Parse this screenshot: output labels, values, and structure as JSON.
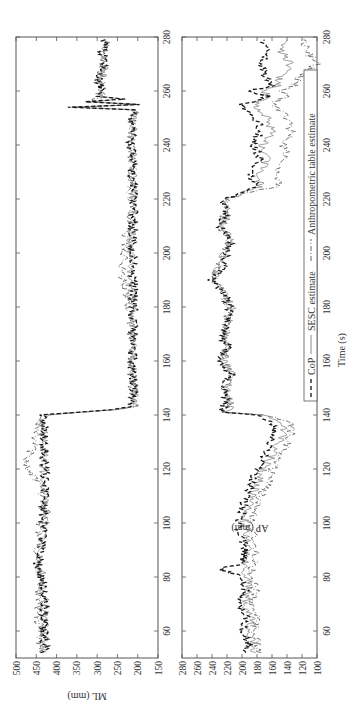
{
  "chart_data": [
    {
      "type": "line",
      "panel": "top",
      "ylabel": "ML (mm)",
      "xlabel": "",
      "xlim": [
        50,
        280
      ],
      "ylim": [
        150,
        500
      ],
      "yticks": [
        500,
        450,
        400,
        350,
        300,
        250,
        200,
        150
      ],
      "xticks": [
        60,
        80,
        100,
        120,
        140,
        160,
        180,
        200,
        220,
        240,
        260,
        280
      ],
      "grid": false,
      "series": [
        {
          "name": "CoP",
          "style": "dashed",
          "x": [
            52,
            60,
            70,
            80,
            85,
            90,
            100,
            110,
            120,
            130,
            136,
            138,
            140,
            141,
            142,
            143,
            145,
            150,
            160,
            170,
            180,
            190,
            200,
            210,
            220,
            230,
            240,
            250,
            253,
            254,
            255,
            256,
            257,
            258,
            260,
            265,
            270,
            275,
            279
          ],
          "y": [
            430,
            432,
            428,
            437,
            448,
            440,
            430,
            430,
            428,
            430,
            432,
            440,
            430,
            350,
            260,
            215,
            208,
            212,
            215,
            212,
            210,
            212,
            215,
            212,
            210,
            212,
            215,
            212,
            205,
            372,
            195,
            330,
            240,
            300,
            290,
            295,
            285,
            285,
            280
          ]
        },
        {
          "name": "SESC estimate",
          "style": "solid",
          "x": [
            52,
            60,
            70,
            80,
            85,
            90,
            100,
            110,
            120,
            130,
            136,
            138,
            140,
            141,
            142,
            143,
            145,
            150,
            160,
            170,
            180,
            190,
            200,
            210,
            220,
            230,
            240,
            250,
            253,
            254,
            255,
            256,
            257,
            258,
            260,
            265,
            270,
            275,
            279
          ],
          "y": [
            432,
            433,
            430,
            436,
            445,
            438,
            432,
            430,
            430,
            432,
            435,
            438,
            428,
            345,
            255,
            212,
            205,
            210,
            213,
            212,
            212,
            220,
            218,
            214,
            210,
            213,
            214,
            213,
            207,
            360,
            198,
            320,
            245,
            296,
            288,
            290,
            282,
            283,
            278
          ]
        },
        {
          "name": "Anthropometric table estimate",
          "style": "dashdot",
          "x": [
            52,
            60,
            70,
            80,
            90,
            100,
            105,
            110,
            115,
            120,
            125,
            130,
            136,
            138,
            140,
            141,
            142,
            143,
            145,
            150,
            160,
            170,
            180,
            190,
            195,
            200,
            210,
            220,
            230,
            240,
            250,
            253,
            254,
            255,
            256,
            258,
            260,
            265,
            270,
            275,
            279
          ],
          "y": [
            440,
            442,
            445,
            440,
            445,
            438,
            425,
            435,
            445,
            478,
            468,
            455,
            440,
            440,
            425,
            340,
            250,
            210,
            207,
            212,
            216,
            216,
            220,
            235,
            240,
            232,
            225,
            215,
            215,
            216,
            213,
            206,
            355,
            200,
            320,
            292,
            290,
            292,
            285,
            284,
            280
          ]
        }
      ]
    },
    {
      "type": "line",
      "panel": "bottom",
      "ylabel": "AP (mm)",
      "xlabel": "Time (s)",
      "xlim": [
        50,
        280
      ],
      "ylim": [
        95,
        280
      ],
      "yticks": [
        280,
        260,
        240,
        220,
        200,
        180,
        160,
        140,
        120,
        100
      ],
      "xticks": [
        60,
        80,
        100,
        120,
        140,
        160,
        180,
        200,
        220,
        240,
        260,
        280
      ],
      "grid": false,
      "legend": {
        "position": "lower right",
        "entries": [
          "CoP",
          "SESC estimate",
          "Anthropometric table estimate"
        ]
      },
      "series": [
        {
          "name": "CoP",
          "style": "dashed",
          "x": [
            52,
            55,
            60,
            65,
            70,
            75,
            80,
            83,
            85,
            90,
            95,
            100,
            105,
            110,
            115,
            120,
            125,
            130,
            135,
            138,
            140,
            141,
            145,
            150,
            155,
            160,
            165,
            170,
            175,
            180,
            185,
            190,
            195,
            200,
            205,
            210,
            215,
            220,
            222,
            225,
            230,
            235,
            240,
            245,
            250,
            255,
            258,
            260,
            262,
            265,
            270,
            275,
            279
          ],
          "y": [
            195,
            190,
            200,
            195,
            205,
            195,
            200,
            230,
            200,
            195,
            200,
            205,
            200,
            195,
            185,
            180,
            170,
            160,
            158,
            165,
            185,
            230,
            220,
            225,
            215,
            230,
            220,
            225,
            220,
            215,
            225,
            240,
            225,
            220,
            215,
            230,
            220,
            225,
            200,
            180,
            190,
            175,
            185,
            175,
            180,
            200,
            165,
            190,
            160,
            170,
            175,
            165,
            170
          ]
        },
        {
          "name": "SESC estimate",
          "style": "solid",
          "x": [
            52,
            55,
            60,
            65,
            70,
            75,
            80,
            85,
            90,
            95,
            100,
            105,
            110,
            115,
            120,
            125,
            130,
            135,
            138,
            140,
            141,
            145,
            150,
            155,
            160,
            165,
            170,
            175,
            180,
            185,
            190,
            195,
            200,
            205,
            210,
            215,
            220,
            222,
            225,
            230,
            235,
            240,
            245,
            250,
            255,
            258,
            260,
            262,
            265,
            270,
            275,
            279
          ],
          "y": [
            188,
            185,
            192,
            188,
            198,
            190,
            195,
            195,
            190,
            195,
            198,
            192,
            188,
            178,
            172,
            160,
            150,
            142,
            150,
            175,
            220,
            215,
            220,
            212,
            225,
            218,
            222,
            218,
            214,
            222,
            238,
            232,
            222,
            216,
            225,
            218,
            222,
            200,
            175,
            178,
            165,
            172,
            160,
            165,
            185,
            160,
            175,
            150,
            150,
            135,
            148,
            140
          ]
        },
        {
          "name": "Anthropometric table estimate",
          "style": "dashdot",
          "x": [
            52,
            55,
            60,
            65,
            70,
            75,
            80,
            85,
            90,
            95,
            100,
            105,
            110,
            115,
            120,
            125,
            130,
            135,
            138,
            140,
            141,
            145,
            150,
            155,
            160,
            165,
            170,
            175,
            180,
            185,
            190,
            195,
            200,
            205,
            210,
            215,
            220,
            222,
            225,
            230,
            235,
            240,
            245,
            250,
            255,
            258,
            260,
            262,
            265,
            270,
            275,
            279
          ],
          "y": [
            180,
            178,
            185,
            180,
            190,
            182,
            188,
            185,
            180,
            185,
            190,
            182,
            175,
            165,
            160,
            148,
            140,
            132,
            140,
            170,
            222,
            218,
            222,
            215,
            225,
            220,
            222,
            220,
            218,
            225,
            235,
            232,
            225,
            220,
            228,
            222,
            222,
            200,
            150,
            155,
            140,
            145,
            135,
            140,
            160,
            140,
            150,
            130,
            125,
            100,
            115,
            118
          ]
        }
      ]
    }
  ],
  "figure": {
    "top_panel_ylabel": "ML (mm)",
    "bottom_panel_ylabel": "AP (mm)",
    "xlabel": "Time (s)",
    "legend": {
      "cop": "CoP",
      "sesc": "SESC estimate",
      "anthro": "Anthropometric table estimate"
    }
  }
}
